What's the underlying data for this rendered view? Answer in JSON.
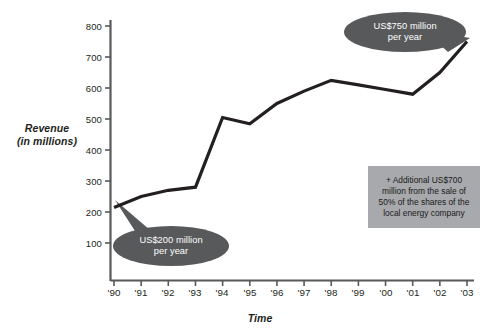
{
  "chart_data": {
    "type": "line",
    "title": "",
    "xlabel": "Time",
    "ylabel": "Revenue (in millions)",
    "ylabel_line1": "Revenue",
    "ylabel_line2": "(in millions)",
    "categories": [
      "'90",
      "'91",
      "'92",
      "'93",
      "'94",
      "'95",
      "'96",
      "'97",
      "'98",
      "'99",
      "'00",
      "'01",
      "'02",
      "'03"
    ],
    "values": [
      215,
      250,
      270,
      280,
      505,
      485,
      550,
      590,
      625,
      610,
      595,
      580,
      650,
      750
    ],
    "ylim": [
      0,
      800
    ],
    "yticks": [
      100,
      200,
      300,
      400,
      500,
      600,
      700,
      800
    ],
    "ytick_labels": [
      "100",
      "200",
      "300",
      "400",
      "500",
      "600",
      "700",
      "800"
    ],
    "grid": false,
    "legend": "none",
    "series_color": "#231f20",
    "annotations": [
      {
        "name": "callout-low",
        "line1": "US$200 million",
        "line2": "per year",
        "value": 200,
        "anchor_category": "'90",
        "bubble_color": "#58595b",
        "text_color": "#ffffff"
      },
      {
        "name": "callout-high",
        "line1": "US$750 million",
        "line2": "per year",
        "value": 750,
        "anchor_category": "'03",
        "bubble_color": "#58595b",
        "text_color": "#ffffff"
      },
      {
        "name": "note-box",
        "line1": "+ Additional US$700",
        "line2": "million from the sale of",
        "line3": "50% of the shares of the",
        "line4": "local energy company",
        "box_color": "#a7a9ac",
        "text_color": "#1a1a1a"
      }
    ]
  },
  "colors": {
    "background": "#ffffff",
    "axis": "#58595b",
    "line": "#231f20",
    "bubble": "#58595b",
    "note_bg": "#a7a9ac",
    "text": "#231f20"
  }
}
